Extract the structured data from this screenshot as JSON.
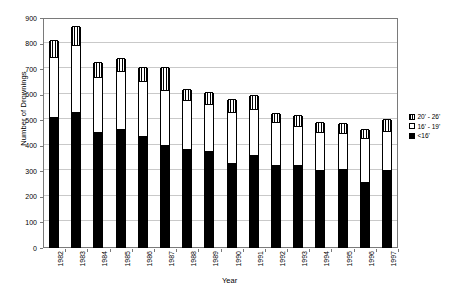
{
  "chart_data": {
    "type": "bar",
    "title": "",
    "subtitle": "",
    "xlabel": "Year",
    "ylabel": "Number of Drownings",
    "ylim": [
      0,
      900
    ],
    "yticks": [
      0,
      100,
      200,
      300,
      400,
      500,
      600,
      700,
      800,
      900
    ],
    "grid": true,
    "stacked": true,
    "legend_position": "right",
    "categories": [
      "1982",
      "1983",
      "1984",
      "1985",
      "1986",
      "1987",
      "1988",
      "1989",
      "1990",
      "1991",
      "1992",
      "1993",
      "1994",
      "1995",
      "1996",
      "1997"
    ],
    "series": [
      {
        "name": "<16'",
        "key": "small",
        "fill": "solid-black",
        "values": [
          510,
          530,
          450,
          460,
          435,
          400,
          385,
          375,
          330,
          360,
          320,
          320,
          300,
          305,
          255,
          300
        ]
      },
      {
        "name": "16' - 19'",
        "key": "mid",
        "fill": "white",
        "values": [
          235,
          260,
          215,
          230,
          215,
          215,
          190,
          185,
          200,
          180,
          170,
          155,
          150,
          140,
          170,
          155
        ]
      },
      {
        "name": "20' - 26'",
        "key": "large",
        "fill": "vertical-stripes",
        "values": [
          65,
          75,
          60,
          50,
          55,
          90,
          45,
          45,
          50,
          55,
          35,
          40,
          40,
          40,
          35,
          45
        ]
      }
    ],
    "totals": [
      810,
      865,
      725,
      740,
      705,
      705,
      620,
      605,
      580,
      595,
      525,
      515,
      490,
      485,
      460,
      500
    ]
  },
  "legend": {
    "entries": [
      {
        "label": "20' - 26'",
        "swatch": "vertical-stripes"
      },
      {
        "label": "16' - 19'",
        "swatch": "white"
      },
      {
        "label": "<16'",
        "swatch": "solid-black"
      }
    ]
  },
  "axes": {
    "y_title": "Number of Drownings",
    "x_title": "Year"
  },
  "colors": {
    "series_small": "#000000",
    "series_mid": "#ffffff",
    "series_large": "#000000",
    "grid": "#c9c9c9",
    "frame": "#7a7a7a",
    "background": "#ffffff"
  }
}
